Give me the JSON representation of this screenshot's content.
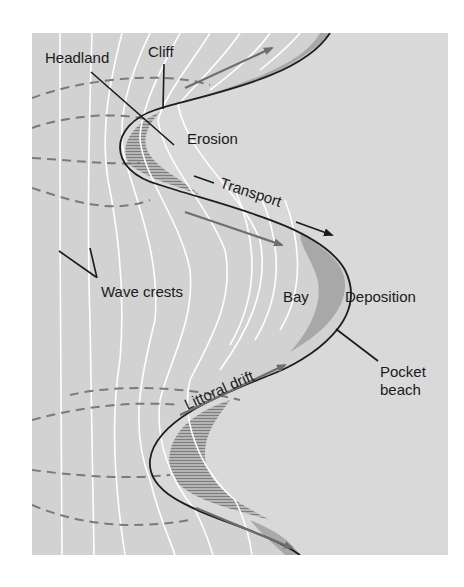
{
  "diagram": {
    "colors": {
      "background": "#ffffff",
      "sea": "#d2d2d2",
      "land": "#d9d9d9",
      "coastline": "#1e1e1e",
      "wave_crest": "#ffffff",
      "wave_ray_dashed": "#7a7a7a",
      "drift_arrow": "#6e6e6e",
      "beach_deposit": "#a8a8a8",
      "erosion_hatch": "#8c8c8c",
      "label_text": "#1a1a1a"
    },
    "labels": {
      "headland": "Headland",
      "cliff": "Cliff",
      "erosion": "Erosion",
      "transport": "Transport",
      "wave_crests": "Wave crests",
      "bay": "Bay",
      "deposition": "Deposition",
      "pocket_beach_line1": "Pocket",
      "pocket_beach_line2": "beach",
      "littoral_drift": "Littoral drift"
    },
    "features": [
      {
        "name": "Headland",
        "type": "coastal landform",
        "location": "upper-left and lower-left protrusions"
      },
      {
        "name": "Cliff",
        "type": "coastal landform",
        "location": "headland face"
      },
      {
        "name": "Erosion",
        "type": "process",
        "location": "headland"
      },
      {
        "name": "Transport",
        "type": "process",
        "direction": "along coast from headland into bay"
      },
      {
        "name": "Wave crests",
        "type": "water feature",
        "note": "white curved lines refracting around headlands"
      },
      {
        "name": "Bay",
        "type": "coastal landform",
        "location": "recess between headlands"
      },
      {
        "name": "Deposition",
        "type": "process",
        "location": "bay head"
      },
      {
        "name": "Pocket beach",
        "type": "coastal landform",
        "location": "bay head"
      },
      {
        "name": "Littoral drift",
        "type": "process",
        "note": "arrows parallel to shore"
      }
    ]
  }
}
